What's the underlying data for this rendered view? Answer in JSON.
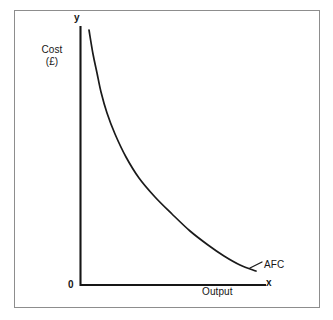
{
  "figure": {
    "background_color": "#ffffff",
    "frame_color": "#8d8d8d",
    "ink_color": "#161616"
  },
  "labels": {
    "y_axis_tip": "y",
    "x_axis_tip": "x",
    "origin": "0",
    "cost_line1": "Cost",
    "cost_line2": "(£)",
    "output": "Output",
    "curve": "AFC"
  },
  "chart_data": {
    "type": "line",
    "title": "",
    "subtitle": "",
    "xlabel": "Output",
    "ylabel": "Cost (£)",
    "curve_label": "AFC",
    "curve_description": "Average Fixed Cost curve: a rectangular hyperbola falling steeply then flattening, asymptotic to both axes",
    "grid": false,
    "legend": false,
    "legend_position": "none",
    "axis_origin_label": "0",
    "x_axis_tip_label": "x",
    "y_axis_tip_label": "y",
    "xlim": [
      0,
      10
    ],
    "ylim": [
      0,
      10
    ],
    "x_tick_labels": [],
    "y_tick_labels": [],
    "series": [
      {
        "name": "AFC",
        "x": [
          0.45,
          0.6,
          0.8,
          1.0,
          1.3,
          1.7,
          2.2,
          2.8,
          3.5,
          4.3,
          5.2,
          6.2,
          7.3,
          8.5,
          9.5
        ],
        "y": [
          9.6,
          7.5,
          5.8,
          4.8,
          3.85,
          3.1,
          2.5,
          2.05,
          1.7,
          1.42,
          1.2,
          1.02,
          0.88,
          0.77,
          0.7
        ],
        "points_px": [
          [
            89,
            30
          ],
          [
            93,
            54
          ],
          [
            97,
            73
          ],
          [
            101,
            92
          ],
          [
            107,
            113
          ],
          [
            115,
            134
          ],
          [
            126,
            157
          ],
          [
            139,
            178
          ],
          [
            155,
            197
          ],
          [
            172,
            214
          ],
          [
            190,
            231
          ],
          [
            208,
            245
          ],
          [
            224,
            256
          ],
          [
            240,
            265
          ],
          [
            256,
            271
          ]
        ]
      }
    ]
  },
  "geometry": {
    "y_axis_x": 80,
    "y_axis_top": 26,
    "axis_baseline_y": 285,
    "x_axis_end": 266,
    "afc_leader_from": [
      250,
      268
    ],
    "afc_leader_to": [
      262,
      262
    ]
  }
}
